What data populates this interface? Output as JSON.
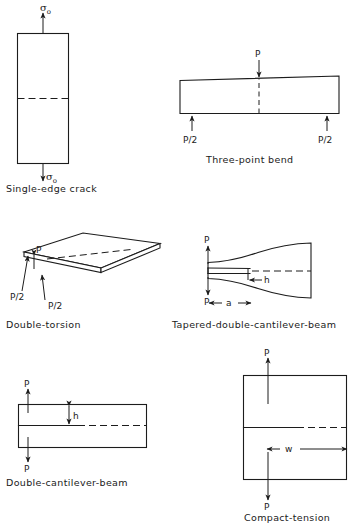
{
  "figure": {
    "background_color": "#ffffff",
    "line_color": "#1c1c1c",
    "specimens": [
      {
        "id": "single-edge-crack",
        "caption": "Single-edge crack",
        "load_top": "σ",
        "load_top_sub": "o",
        "load_bottom": "σ",
        "load_bottom_sub": "o",
        "shape": "rectangle",
        "crack": "horizontal mid-height dashed line entering from left edge"
      },
      {
        "id": "three-point-bend",
        "caption": "Three-point bend",
        "load_center": "P",
        "load_left": "P/2",
        "load_right": "P/2",
        "shape": "slender bar",
        "crack": "vertical mid-span notch, dashed upward"
      },
      {
        "id": "double-torsion",
        "caption": "Double-torsion",
        "load_upper": "P",
        "load_left": "P/2",
        "load_front": "P/2",
        "shape": "thin plate in perspective",
        "crack": "longitudinal dashed centre line"
      },
      {
        "id": "tapered-double-cantilever-beam",
        "caption": "Tapered-double-cantilever-beam",
        "load_top": "P",
        "load_bottom": "P",
        "dim_height": "h",
        "dim_length": "a",
        "shape": "flared tapered arms",
        "crack": "horizontal slot from loaded end, dashed to the right"
      },
      {
        "id": "double-cantilever-beam",
        "caption": "Double-cantilever-beam",
        "load_top": "P",
        "load_bottom": "P",
        "dim_height": "h",
        "shape": "rectangular bar",
        "crack": "horizontal slot from left end, dashed to the right"
      },
      {
        "id": "compact-tension",
        "caption": "Compact-tension",
        "load_top": "P",
        "load_bottom": "P",
        "dim_width": "w",
        "shape": "square plate",
        "crack": "horizontal notch from left edge, dashed to the right"
      }
    ]
  }
}
